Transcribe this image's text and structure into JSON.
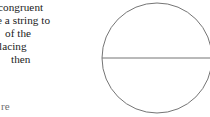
{
  "page": {
    "background_color": "#ffffff",
    "width": 210,
    "height": 117
  },
  "text_block": {
    "description": "paragraph text clipped at the left margin of the scan",
    "text_color": "#1b1b1b",
    "lines": [
      {
        "text": "congruent"
      },
      {
        "text": "e a string to"
      },
      {
        "text": "of the"
      },
      {
        "text": "lacing"
      },
      {
        "text": "then"
      }
    ]
  },
  "bottom_fragment": {
    "text": "re",
    "text_color": "#6f6f6f"
  },
  "diagram": {
    "name": "circle-with-diameter",
    "stroke_color": "#757575",
    "fill_color": "#ffffff",
    "circle": {
      "cx": 57,
      "cy": 58,
      "r": 55
    },
    "diameter_line": {
      "x1": 2,
      "y1": 58,
      "x2": 112,
      "y2": 58
    }
  }
}
